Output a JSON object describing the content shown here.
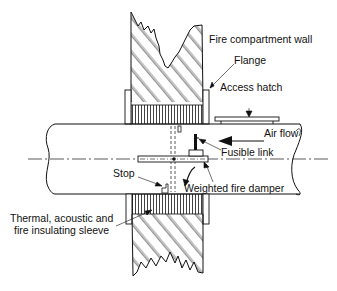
{
  "diagram": {
    "labels": {
      "fire_compartment_wall": "Fire compartment wall",
      "flange": "Flange",
      "access_hatch": "Access hatch",
      "air_flow": "Air flow",
      "fusible_link": "Fusible link",
      "stop": "Stop",
      "weighted_fire_damper": "Weighted fire damper",
      "sleeve_line1": "Thermal, acoustic and",
      "sleeve_line2": "fire insulating sleeve"
    },
    "colors": {
      "ink": "#111111",
      "background": "#ffffff"
    }
  }
}
